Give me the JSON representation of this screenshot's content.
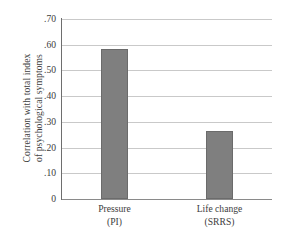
{
  "chart_data": {
    "type": "bar",
    "title": "",
    "subtitle": "",
    "xlabel": "",
    "ylabel": "Correlation with total index of psychological symptoms",
    "ylabel_lines": [
      "Correlation with total index",
      "of psychological symptoms"
    ],
    "categories": [
      "Pressure (PI)",
      "Life change (SRRS)"
    ],
    "category_lines": [
      {
        "line1": "Pressure",
        "line2": "(PI)"
      },
      {
        "line1": "Life change",
        "line2": "(SRRS)"
      }
    ],
    "values": [
      0.585,
      0.265
    ],
    "ylim": [
      0,
      0.7
    ],
    "ytick_values": [
      0.7,
      0.6,
      0.5,
      0.4,
      0.3,
      0.2,
      0.1,
      0
    ],
    "ytick_labels": [
      ".70",
      ".60",
      ".50",
      ".40",
      ".30",
      ".20",
      ".10",
      "0"
    ],
    "grid": true,
    "grid_axis": "y",
    "legend": false,
    "legend_position": "none",
    "bar_color": "#7f7f7f",
    "bar_edge_color": "#6b6b6b",
    "grid_color": "#c9c9c9",
    "axis_color": "#6e6e6e",
    "text_color": "#3d3d3d",
    "background_color": "#ffffff"
  }
}
